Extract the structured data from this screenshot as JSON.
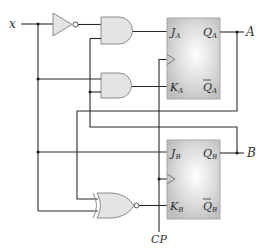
{
  "diagram": {
    "type": "sequential-logic-circuit",
    "input_label": "x",
    "clock_label": "CP",
    "outputs": [
      "A",
      "B"
    ],
    "flip_flops": [
      {
        "name": "A",
        "inputs": [
          {
            "base": "J",
            "sub": "A"
          },
          {
            "base": "K",
            "sub": "A"
          }
        ],
        "outputs": [
          {
            "base": "Q",
            "sub": "A",
            "bar": false
          },
          {
            "base": "Q",
            "sub": "A",
            "bar": true
          }
        ]
      },
      {
        "name": "B",
        "inputs": [
          {
            "base": "J",
            "sub": "B"
          },
          {
            "base": "K",
            "sub": "B"
          }
        ],
        "outputs": [
          {
            "base": "Q",
            "sub": "B",
            "bar": false
          },
          {
            "base": "Q",
            "sub": "B",
            "bar": true
          }
        ]
      }
    ],
    "gates": [
      {
        "id": "inv1",
        "type": "NOT",
        "input": "x"
      },
      {
        "id": "and1",
        "type": "AND",
        "inputs": [
          "x'",
          "B"
        ],
        "output": "JA"
      },
      {
        "id": "and2",
        "type": "AND",
        "inputs": [
          "x",
          "B"
        ],
        "output": "KA"
      },
      {
        "id": "xnor1",
        "type": "XNOR",
        "inputs": [
          "A",
          "x"
        ],
        "output": "KB"
      }
    ],
    "connections": {
      "JB": "x"
    },
    "colors": {
      "gate_fill": "#e4e4e4",
      "ff_fill": "#c8c8c8",
      "wire": "#2a2a2a"
    }
  },
  "labels": {
    "x": "x",
    "A": "A",
    "B": "B",
    "CP": "CP",
    "JA": "J",
    "JA_sub": "A",
    "KA": "K",
    "KA_sub": "A",
    "QA": "Q",
    "QA_sub": "A",
    "QAbar": "Q",
    "QAbar_sub": "A",
    "JB": "J",
    "JB_sub": "B",
    "KB": "K",
    "KB_sub": "B",
    "QB": "Q",
    "QB_sub": "B",
    "QBbar": "Q",
    "QBbar_sub": "B"
  }
}
